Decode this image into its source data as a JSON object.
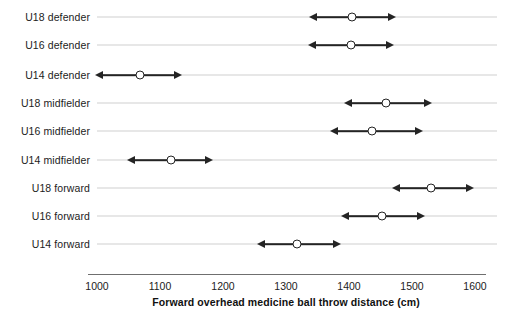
{
  "chart_data": {
    "type": "scatter",
    "title": "",
    "xlabel": "Forward overhead medicine ball throw distance (cm)",
    "ylabel": "",
    "xlim": [
      1000,
      1600
    ],
    "xticks": [
      1000,
      1100,
      1200,
      1300,
      1400,
      1500,
      1600
    ],
    "xtick_labels": [
      "1000",
      "1100",
      "1200",
      "1300",
      "1400",
      "1500",
      "1600"
    ],
    "grid": true,
    "legend": "none",
    "orientation": "horizontal",
    "marker_style": "open-circle",
    "range_style": "double-headed-arrow",
    "categories": [
      "U18 defender",
      "U16 defender",
      "U14 defender",
      "U18 midfielder",
      "U16 midfielder",
      "U14 midfielder",
      "U18 forward",
      "U16 forward",
      "U14 forward"
    ],
    "values": [
      1405,
      1403,
      1068,
      1459,
      1436,
      1117,
      1530,
      1452,
      1317
    ],
    "low": [
      1337,
      1335,
      997,
      1392,
      1370,
      1048,
      1468,
      1387,
      1254
    ],
    "high": [
      1474,
      1472,
      1135,
      1531,
      1518,
      1184,
      1598,
      1521,
      1387
    ],
    "points": [
      {
        "category": "U18 defender",
        "value": 1405,
        "low": 1337,
        "high": 1474
      },
      {
        "category": "U16 defender",
        "value": 1403,
        "low": 1335,
        "high": 1472
      },
      {
        "category": "U14 defender",
        "value": 1068,
        "low": 997,
        "high": 1135
      },
      {
        "category": "U18 midfielder",
        "value": 1459,
        "low": 1392,
        "high": 1531
      },
      {
        "category": "U16 midfielder",
        "value": 1436,
        "low": 1370,
        "high": 1518
      },
      {
        "category": "U14 midfielder",
        "value": 1117,
        "low": 1048,
        "high": 1184
      },
      {
        "category": "U18 forward",
        "value": 1530,
        "low": 1468,
        "high": 1598
      },
      {
        "category": "U16 forward",
        "value": 1452,
        "low": 1387,
        "high": 1521
      },
      {
        "category": "U14 forward",
        "value": 1317,
        "low": 1254,
        "high": 1387
      }
    ]
  },
  "colors": {
    "marker_edge": "#242424",
    "range_line": "#242424",
    "gridline": "#cfcfcf",
    "axis": "#6f6f6f",
    "text": "#1c1c1c",
    "background": "#ffffff"
  }
}
